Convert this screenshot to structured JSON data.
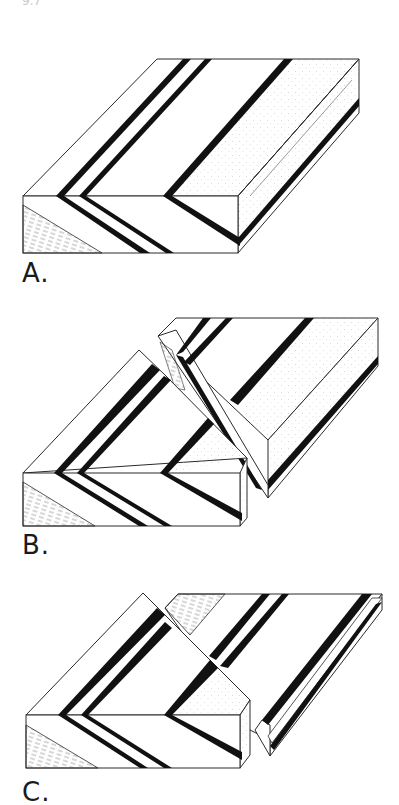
{
  "figure": {
    "top_fragment": "9.7",
    "panels": [
      {
        "id": "A",
        "label": "A.",
        "description": "Unfaulted block with folded strata (V-shaped outcrop pattern of dark beds)"
      },
      {
        "id": "B",
        "label": "B.",
        "description": "Block displaced along oblique fault; right block raised"
      },
      {
        "id": "C",
        "label": "C.",
        "description": "Eroded surface after faulting; offset outcrop pattern of beds"
      }
    ],
    "colors": {
      "line": "#2a2a2a",
      "band": "#111111",
      "stipple": "#b8b8b8",
      "background": "#ffffff"
    }
  }
}
